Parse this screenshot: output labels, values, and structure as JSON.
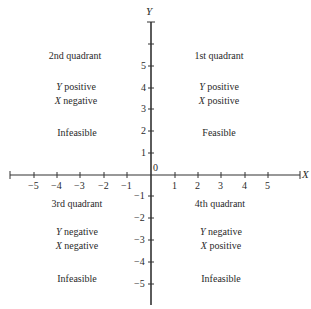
{
  "axes": {
    "x_label": "X",
    "y_label": "Y",
    "origin_label": "0",
    "x_ticks": [
      "−5",
      "−4",
      "−3",
      "−2",
      "−1",
      "1",
      "2",
      "3",
      "4",
      "5"
    ],
    "y_ticks": [
      "5",
      "4",
      "3",
      "2",
      "1",
      "−1",
      "−2",
      "−3",
      "−4",
      "−5"
    ]
  },
  "quadrants": [
    {
      "title": "1st quadrant",
      "y_var": "Y",
      "y_sign": "positive",
      "x_var": "X",
      "x_sign": "positive",
      "status": "Feasible"
    },
    {
      "title": "2nd quadrant",
      "y_var": "Y",
      "y_sign": "positive",
      "x_var": "X",
      "x_sign": "negative",
      "status": "Infeasible"
    },
    {
      "title": "3rd quadrant",
      "y_var": "Y",
      "y_sign": "negative",
      "x_var": "X",
      "x_sign": "negative",
      "status": "Infeasible"
    },
    {
      "title": "4th quadrant",
      "y_var": "Y",
      "y_sign": "negative",
      "x_var": "X",
      "x_sign": "positive",
      "status": "Infeasible"
    }
  ],
  "colors": {
    "axis": "#333333",
    "text": "#2a2a2a"
  }
}
